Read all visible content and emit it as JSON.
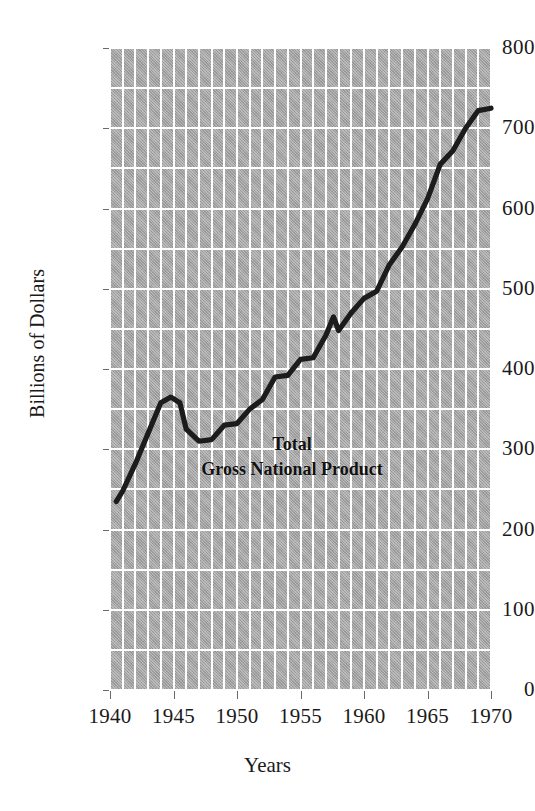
{
  "chart_data": {
    "type": "line",
    "title": "",
    "xlabel": "Years",
    "ylabel": "Billions of Dollars",
    "xlim": [
      1940,
      1970
    ],
    "ylim": [
      0,
      800
    ],
    "grid": true,
    "legend_position": "inline-annotation",
    "annotations": [
      {
        "text_line1": "Total",
        "text_line2": "Gross National Product",
        "x": 1952.5,
        "y": 330
      }
    ],
    "xticks": [
      1940,
      1945,
      1950,
      1955,
      1960,
      1965,
      1970
    ],
    "xtick_labels": [
      "1940",
      "1945",
      "1950",
      "1955",
      "1960",
      "1965",
      "1970"
    ],
    "yticks": [
      0,
      100,
      200,
      300,
      400,
      500,
      600,
      700,
      800
    ],
    "ytick_labels": [
      "0",
      "100",
      "200",
      "300",
      "400",
      "500",
      "600",
      "700",
      "800"
    ],
    "minor_grid_x_step": 1,
    "minor_grid_y_step": 50,
    "series": [
      {
        "name": "Total Gross National Product",
        "color": "#1c1c1c",
        "x": [
          1940.5,
          1941,
          1942,
          1943,
          1944,
          1944.8,
          1945.5,
          1946,
          1947,
          1948,
          1949,
          1950,
          1951,
          1952,
          1953,
          1954,
          1955,
          1956,
          1957,
          1957.6,
          1958,
          1959,
          1960,
          1961,
          1962,
          1963,
          1964,
          1965,
          1966,
          1967,
          1968,
          1969,
          1970
        ],
        "y": [
          235,
          248,
          282,
          320,
          358,
          365,
          358,
          325,
          310,
          312,
          330,
          332,
          350,
          362,
          390,
          392,
          412,
          414,
          442,
          465,
          448,
          470,
          488,
          497,
          530,
          552,
          580,
          612,
          655,
          672,
          700,
          722,
          725
        ]
      }
    ]
  },
  "axes": {
    "y_title": "Billions of Dollars",
    "x_title": "Years"
  }
}
